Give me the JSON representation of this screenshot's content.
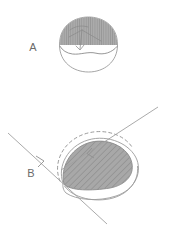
{
  "figure": {
    "title": "",
    "background_color": "#ffffff",
    "width": 172,
    "height": 236,
    "style": "hand-drawn pencil sketch, grayscale",
    "panels": [
      {
        "id": "A",
        "label": "A",
        "label_color": "#6b6b6b",
        "label_x": 33,
        "label_y": 51,
        "description": "Dome / hemispherical cap outline with an upper shaded (gray hatched) region and an unshaded lower crescent",
        "shape": {
          "name": "dome-outline",
          "outline_color": "#8a8a8a",
          "fill_color": "#ffffff",
          "shaded_region_color": "#a9a9a9",
          "hatch_color": "#8d8d8d",
          "hatch_direction": "vertical"
        },
        "interior_marks": {
          "name": "sketch-axes",
          "color": "#7a7a7a",
          "description": "faint crossing pencil strokes inside the shaded cap"
        }
      },
      {
        "id": "B",
        "label": "B",
        "label_color": "#6b6b6b",
        "label_x": 31,
        "label_y": 177,
        "description": "Tilted dome with a diagonally hatched gray lens region, a dashed arc outlining the original cap position, an outer solid outline, and two parallel oblique tangent lines with arrowheads",
        "shape": {
          "name": "tilted-dome-outline",
          "outline_color": "#8a8a8a",
          "fill_color": "#ffffff",
          "shaded_region_color": "#a9a9a9",
          "hatch_color": "#8d8d8d",
          "hatch_direction": "diagonal-45"
        },
        "dashed_arc": {
          "name": "dashed-reference-arc",
          "color": "#8a8a8a",
          "dash_pattern": "3 3"
        },
        "tangent_lines": [
          {
            "name": "upper-tangent-line",
            "color": "#9a9a9a",
            "arrow": "up-right",
            "x1": 60,
            "y1": 170,
            "x2": 158,
            "y2": 108
          },
          {
            "name": "lower-tangent-line",
            "color": "#9a9a9a",
            "arrow": "down-left",
            "x1": 8,
            "y1": 133,
            "x2": 106,
            "y2": 224
          }
        ]
      }
    ]
  }
}
